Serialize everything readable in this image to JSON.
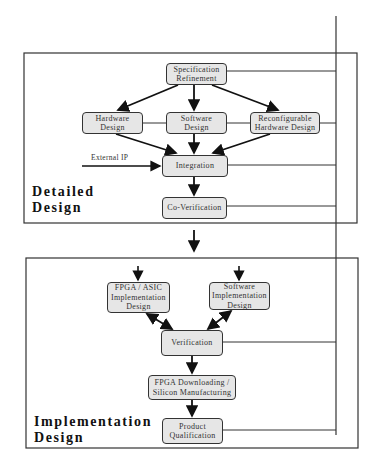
{
  "diagram": {
    "stages": [
      {
        "id": "detailed",
        "label": "Detailed\nDesign"
      },
      {
        "id": "implementation",
        "label": "Implementation\nDesign"
      }
    ],
    "nodes": {
      "spec": "Specification\nRefinement",
      "hw": "Hardware\nDesign",
      "sw": "Software\nDesign",
      "reconf": "Reconfigurable\nHardware Design",
      "integration": "Integration",
      "coverif": "Co-Verification",
      "fpga_asic": "FPGA / ASIC\nImplementation\nDesign",
      "sw_impl": "Software\nImplementation\nDesign",
      "verification": "Verification",
      "fpga_dl": "FPGA Downloading /\nSilicon Manufacturing",
      "product": "Product\nQualification"
    },
    "external_input": "External IP",
    "colors": {
      "node_fill": "#e6e6e6",
      "line": "#333333"
    }
  }
}
